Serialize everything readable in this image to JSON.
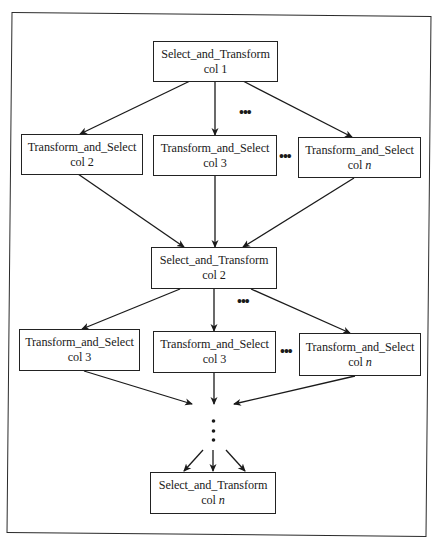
{
  "diagram": {
    "type": "flowchart",
    "nodes": {
      "st1": {
        "title": "Select_and_Transform",
        "sub_prefix": "col ",
        "sub_value": "1"
      },
      "ts_r1_a": {
        "title": "Transform_and_Select",
        "sub_prefix": "col ",
        "sub_value": "2"
      },
      "ts_r1_b": {
        "title": "Transform_and_Select",
        "sub_prefix": "col ",
        "sub_value": "3"
      },
      "ts_r1_n": {
        "title": "Transform_and_Select",
        "sub_prefix": "col ",
        "sub_value": "n"
      },
      "st2": {
        "title": "Select_and_Transform",
        "sub_prefix": "col ",
        "sub_value": "2"
      },
      "ts_r2_a": {
        "title": "Transform_and_Select",
        "sub_prefix": "col ",
        "sub_value": "3"
      },
      "ts_r2_b": {
        "title": "Transform_and_Select",
        "sub_prefix": "col ",
        "sub_value": "3"
      },
      "ts_r2_n": {
        "title": "Transform_and_Select",
        "sub_prefix": "col ",
        "sub_value": "n"
      },
      "stn": {
        "title": "Select_and_Transform",
        "sub_prefix": "col ",
        "sub_value": "n"
      }
    },
    "ellipses": {
      "horizontal": "•••",
      "vertical": "⋮"
    },
    "edges": [
      [
        "st1",
        "ts_r1_a"
      ],
      [
        "st1",
        "ts_r1_b"
      ],
      [
        "st1",
        "ts_r1_n"
      ],
      [
        "ts_r1_a",
        "st2"
      ],
      [
        "ts_r1_b",
        "st2"
      ],
      [
        "ts_r1_n",
        "st2"
      ],
      [
        "st2",
        "ts_r2_a"
      ],
      [
        "st2",
        "ts_r2_b"
      ],
      [
        "st2",
        "ts_r2_n"
      ],
      [
        "ts_r2_a",
        "vertical-ellipsis"
      ],
      [
        "ts_r2_b",
        "vertical-ellipsis"
      ],
      [
        "ts_r2_n",
        "vertical-ellipsis"
      ],
      [
        "vertical-ellipsis",
        "stn"
      ]
    ]
  }
}
